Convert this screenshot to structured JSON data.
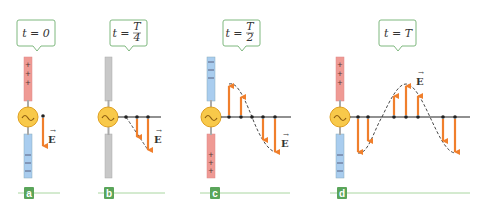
{
  "figure": {
    "colors": {
      "positive_rod": "#ef9a94",
      "negative_rod": "#a9cdef",
      "neutral_rod": "#c8c8c8",
      "source_fill": "#f8c94a",
      "source_stroke": "#e0a020",
      "arrow": "#f07f2c",
      "callout_border": "#7fb87f",
      "label_bg": "#5aa55a",
      "baseline": "#a9d6a0"
    },
    "field_symbol": "E",
    "panels": [
      {
        "id": "a",
        "label": "a",
        "time_label": "t = 0",
        "top_rod": "positive",
        "bottom_rod": "negative",
        "top_signs": "+ + +",
        "bottom_signs": "– – –"
      },
      {
        "id": "b",
        "label": "b",
        "time_label_prefix": "t = ",
        "time_num": "T",
        "time_den": "4",
        "top_rod": "neutral",
        "bottom_rod": "neutral"
      },
      {
        "id": "c",
        "label": "c",
        "time_label_prefix": "t = ",
        "time_num": "T",
        "time_den": "2",
        "top_rod": "negative",
        "bottom_rod": "positive",
        "top_signs": "– – –",
        "bottom_signs": "+ + +"
      },
      {
        "id": "d",
        "label": "d",
        "time_label": "t = T",
        "top_rod": "positive",
        "bottom_rod": "negative",
        "top_signs": "+ + +",
        "bottom_signs": "– – –"
      }
    ]
  }
}
